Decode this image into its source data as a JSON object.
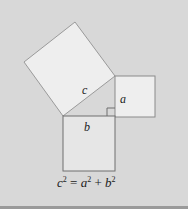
{
  "figure": {
    "labels": {
      "c": "c",
      "a": "a",
      "b": "b"
    },
    "equation": {
      "lhs_var": "c",
      "lhs_exp": "2",
      "equals": " = ",
      "term1_var": "a",
      "term1_exp": "2",
      "plus": " + ",
      "term2_var": "b",
      "term2_exp": "2"
    },
    "colors": {
      "background": "#d8d8d8",
      "square_fill": "#eeeeee",
      "square_stroke": "#8a8a8a",
      "bottom_rule": "#9a9a9a"
    }
  }
}
